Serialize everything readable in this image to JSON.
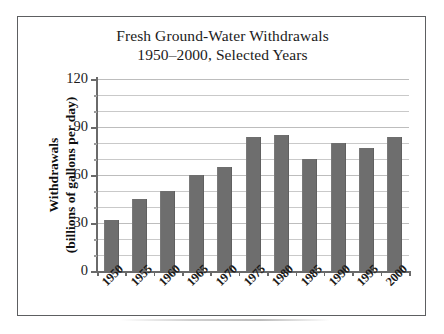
{
  "figure": {
    "title_line1": "Fresh Ground-Water Withdrawals",
    "title_line2": "1950–2000, Selected Years",
    "y_axis_title_line1": "Withdrawals",
    "y_axis_title_line2": "(billions of gallons per day)",
    "bar_color": "#6e6e6e",
    "grid_color": "#c9c9c9",
    "axis_color": "#6a6a6a",
    "frame_color": "#5d5f61",
    "text_color": "#1b1b1b",
    "background": "#ffffff"
  },
  "chart_data": {
    "type": "bar",
    "title": "Fresh Ground-Water Withdrawals 1950–2000, Selected Years",
    "xlabel": "",
    "ylabel": "Withdrawals (billions of gallons per day)",
    "categories": [
      "1950",
      "1955",
      "1960",
      "1965",
      "1970",
      "1975",
      "1980",
      "1985",
      "1990",
      "1995",
      "2000"
    ],
    "values": [
      32,
      45,
      50,
      60,
      65,
      84,
      85,
      70,
      80,
      77,
      84
    ],
    "ylim": [
      0,
      120
    ],
    "ytick_labels": [
      "0",
      "30",
      "60",
      "90",
      "120"
    ],
    "ytick_values": [
      0,
      30,
      60,
      90,
      120
    ],
    "minor_gridline_values": [
      10,
      20,
      40,
      50,
      70,
      80,
      100,
      110
    ],
    "grid": true,
    "legend": false,
    "units": "billions of gallons per day"
  }
}
